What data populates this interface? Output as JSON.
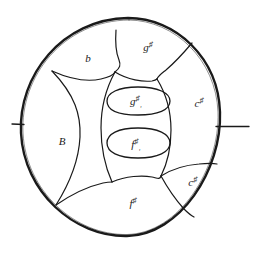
{
  "diagram": {
    "shell_shape": "circle",
    "ink_color": "#1a1a1a",
    "paper_color": "#ffffff",
    "tick_marks": [
      {
        "name": "left-edge-tick",
        "side": "left"
      },
      {
        "name": "right-edge-tick",
        "side": "right"
      }
    ],
    "tonefields": [
      {
        "id": "ding",
        "label_base": "B",
        "accidental": "",
        "subscript": "",
        "position": "left-center"
      },
      {
        "id": "b",
        "label_base": "b",
        "accidental": "",
        "subscript": "",
        "position": "upper-left"
      },
      {
        "id": "g-sharp",
        "label_base": "g",
        "accidental": "♯",
        "subscript": "",
        "position": "top"
      },
      {
        "id": "c-sharp",
        "label_base": "c",
        "accidental": "♯",
        "subscript": "",
        "position": "right"
      },
      {
        "id": "c-sharp-1",
        "label_base": "c",
        "accidental": "♯",
        "subscript": "₁",
        "position": "lower-right"
      },
      {
        "id": "f-sharp",
        "label_base": "f",
        "accidental": "♯",
        "subscript": "",
        "position": "bottom"
      },
      {
        "id": "g-sharp-1",
        "label_base": "g",
        "accidental": "♯",
        "subscript": "₁",
        "position": "center-upper-ellipse"
      },
      {
        "id": "f-sharp-1",
        "label_base": "f",
        "accidental": "♯",
        "subscript": "₁",
        "position": "center-lower-ellipse"
      }
    ]
  }
}
